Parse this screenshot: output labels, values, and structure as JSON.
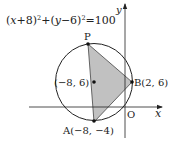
{
  "diagram": {
    "equation": {
      "open1": "(",
      "x": "x",
      "plus8": "+8)",
      "sq1": "2",
      "plus": "+(",
      "y": "y",
      "minus6": "−6)",
      "sq2": "2",
      "equals": "=100"
    },
    "axes": {
      "x_label": "x",
      "y_label": "y",
      "origin_label": "O"
    },
    "points": {
      "P": {
        "label": "P"
      },
      "center": {
        "label": "(−8, 6)"
      },
      "B": {
        "label": "B(2, 6)"
      },
      "A": {
        "label": "A(−8, −4)"
      }
    },
    "colors": {
      "stroke": "#222222",
      "fill": "#c4c4c4"
    }
  }
}
